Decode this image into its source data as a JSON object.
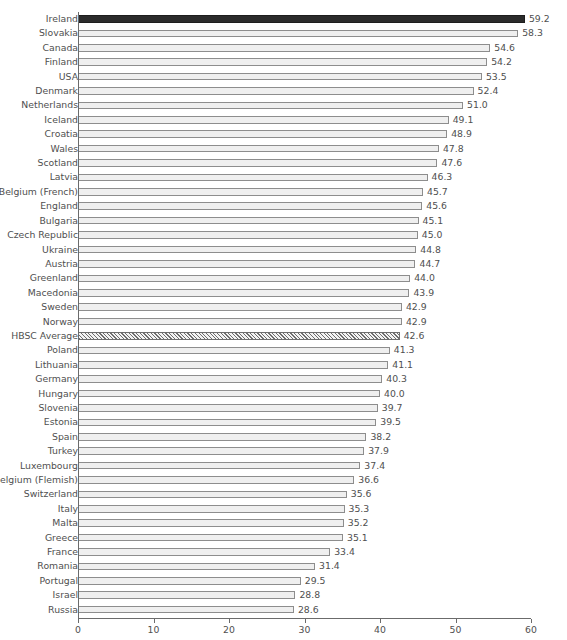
{
  "header": {
    "cut_off_text": ""
  },
  "chart_data": {
    "type": "bar",
    "orientation": "horizontal",
    "title": "",
    "xlabel": "% of children",
    "ylabel": "",
    "xlim": [
      0,
      60
    ],
    "xticks": [
      0,
      10,
      20,
      30,
      40,
      50,
      60
    ],
    "xtick_labels": [
      "0",
      "10",
      "20",
      "30",
      "40",
      "50",
      "60"
    ],
    "grid": false,
    "legend": "none",
    "highlight_color": "#2b2b2b",
    "bar_fill_color": "#efefef",
    "bar_edge_color": "#8d8d8d",
    "categories": [
      "Ireland",
      "Slovakia",
      "Canada",
      "Finland",
      "USA",
      "Denmark",
      "Netherlands",
      "Iceland",
      "Croatia",
      "Wales",
      "Scotland",
      "Latvia",
      "Belgium (French)",
      "England",
      "Bulgaria",
      "Czech Republic",
      "Ukraine",
      "Austria",
      "Greenland",
      "Macedonia",
      "Sweden",
      "Norway",
      "HBSC Average",
      "Poland",
      "Lithuania",
      "Germany",
      "Hungary",
      "Slovenia",
      "Estonia",
      "Spain",
      "Turkey",
      "Luxembourg",
      "Belgium (Flemish)",
      "Switzerland",
      "Italy",
      "Malta",
      "Greece",
      "France",
      "Romania",
      "Portugal",
      "Israel",
      "Russia"
    ],
    "values": [
      59.2,
      58.3,
      54.6,
      54.2,
      53.5,
      52.4,
      51.0,
      49.1,
      48.9,
      47.8,
      47.6,
      46.3,
      45.7,
      45.6,
      45.1,
      45.0,
      44.8,
      44.7,
      44.0,
      43.9,
      42.9,
      42.9,
      42.6,
      41.3,
      41.1,
      40.3,
      40.0,
      39.7,
      39.5,
      38.2,
      37.9,
      37.4,
      36.6,
      35.6,
      35.3,
      35.2,
      35.1,
      33.4,
      31.4,
      29.5,
      28.8,
      28.6
    ],
    "value_labels": [
      "59.2",
      "58.3",
      "54.6",
      "54.2",
      "53.5",
      "52.4",
      "51.0",
      "49.1",
      "48.9",
      "47.8",
      "47.6",
      "46.3",
      "45.7",
      "45.6",
      "45.1",
      "45.0",
      "44.8",
      "44.7",
      "44.0",
      "43.9",
      "42.9",
      "42.9",
      "42.6",
      "41.3",
      "41.1",
      "40.3",
      "40.0",
      "39.7",
      "39.5",
      "38.2",
      "37.9",
      "37.4",
      "36.6",
      "35.6",
      "35.3",
      "35.2",
      "35.1",
      "33.4",
      "31.4",
      "29.5",
      "28.8",
      "28.6"
    ],
    "styles": [
      "highlight",
      "plain",
      "plain",
      "plain",
      "plain",
      "plain",
      "plain",
      "plain",
      "plain",
      "plain",
      "plain",
      "plain",
      "plain",
      "plain",
      "plain",
      "plain",
      "plain",
      "plain",
      "plain",
      "plain",
      "plain",
      "plain",
      "hatched",
      "plain",
      "plain",
      "plain",
      "plain",
      "plain",
      "plain",
      "plain",
      "plain",
      "plain",
      "plain",
      "plain",
      "plain",
      "plain",
      "plain",
      "plain",
      "plain",
      "plain",
      "plain",
      "plain"
    ]
  }
}
